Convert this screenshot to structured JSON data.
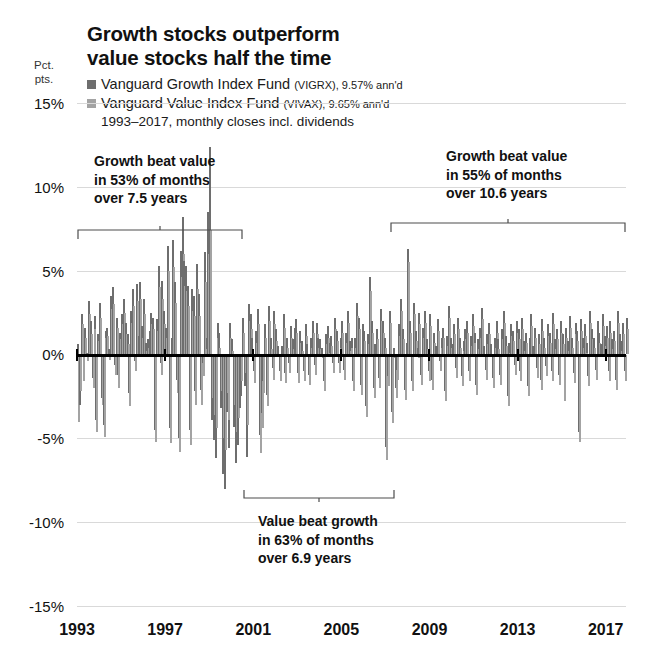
{
  "chart_data": {
    "type": "bar",
    "title": "Growth stocks outperform\nvalue stocks half the time",
    "subtitle": "1993–2017, monthly closes incl. dividends",
    "xlabel": "",
    "ylabel": "Pct.\npts.",
    "ylim": [
      -15,
      15
    ],
    "xlim": [
      1993,
      2017.92
    ],
    "grid": true,
    "legend_position": "top-left",
    "ytick_labels": [
      "15%",
      "10%",
      "5%",
      "0%",
      "-5%",
      "-10%",
      "-15%"
    ],
    "ytick_values": [
      15,
      10,
      5,
      0,
      -5,
      -10,
      -15
    ],
    "xtick_labels": [
      "1993",
      "1997",
      "2001",
      "2005",
      "2009",
      "2013",
      "2017"
    ],
    "xtick_values": [
      1993,
      1997,
      2001,
      2005,
      2009,
      2013,
      2017
    ],
    "series": [
      {
        "name": "Vanguard Growth Index Fund",
        "ticker": "VIGRX",
        "annualized": "9.57% ann'd",
        "color": "#6e6e6e"
      },
      {
        "name": "Vanguard Value Index Fund",
        "ticker": "VIVAX",
        "annualized": "9.65% ann'd",
        "color": "#a3a3a3"
      }
    ],
    "growth_values": [
      0.6,
      -3.0,
      2.4,
      -1.0,
      1.6,
      0.1,
      3.2,
      2.0,
      -1.4,
      2.3,
      -3.9,
      1.2,
      3.1,
      -2.6,
      -4.2,
      1.4,
      1.6,
      0.3,
      3.5,
      4.0,
      -0.6,
      2.2,
      -1.2,
      1.3,
      2.4,
      3.3,
      1.9,
      1.2,
      -2.3,
      2.6,
      3.9,
      -0.4,
      4.2,
      1.1,
      4.3,
      1.7,
      3.3,
      0.7,
      0.9,
      1.4,
      2.5,
      2.2,
      -4.5,
      2.1,
      5.3,
      -0.5,
      4.4,
      2.6,
      1.6,
      6.5,
      -4.4,
      1.0,
      6.8,
      4.3,
      -1.5,
      -5.0,
      6.2,
      8.2,
      5.6,
      5.3,
      4.1,
      -4.5,
      3.9,
      3.5,
      -2.2,
      5.4,
      3.6,
      -2.1,
      -0.5,
      6.1,
      1.0,
      8.5,
      12.4,
      -3.9,
      -5.1,
      -6.2,
      1.9,
      1.3,
      -3.2,
      -7.1,
      -8.0,
      -3.4,
      -5.6,
      1.9,
      0.9,
      -4.3,
      -6.5,
      -5.4,
      -3.2,
      -2.5,
      2.2,
      -1.9,
      -6.1,
      3.0,
      2.4,
      1.0,
      -1.0,
      1.4,
      2.7,
      -4.8,
      -3.5,
      -1.6,
      1.8,
      -2.4,
      2.9,
      1.0,
      -0.8,
      2.6,
      1.5,
      0.5,
      -1.0,
      0.5,
      2.4,
      -1.1,
      1.0,
      -0.5,
      1.7,
      0.9,
      1.6,
      2.1,
      -1.1,
      1.4,
      0.8,
      -1.0,
      1.8,
      0.6,
      -1.2,
      1.0,
      2.0,
      -0.6,
      1.9,
      1.0,
      0.9,
      0.4,
      -1.6,
      1.2,
      1.7,
      0.7,
      1.1,
      -0.5,
      2.2,
      1.4,
      -0.5,
      1.0,
      2.0,
      -0.9,
      1.3,
      2.6,
      0.8,
      1.0,
      -1.6,
      1.0,
      3.1,
      2.2,
      -1.8,
      1.8,
      1.4,
      -3.1,
      1.2,
      4.6,
      2.0,
      -2.0,
      0.6,
      1.5,
      -1.4,
      2.7,
      2.0,
      1.0,
      -5.5,
      -1.3,
      2.6,
      -3.4,
      0.4,
      -2.0,
      -0.9,
      1.8,
      3.3,
      1.5,
      -2.1,
      0.7,
      6.3,
      2.0,
      -1.6,
      3.1,
      1.4,
      0.4,
      2.5,
      -1.2,
      1.6,
      2.6,
      0.9,
      -1.0,
      2.4,
      -1.5,
      1.3,
      0.5,
      2.1,
      -0.4,
      1.0,
      1.6,
      -2.2,
      1.1,
      2.9,
      1.0,
      0.6,
      1.8,
      -0.8,
      2.2,
      1.0,
      -1.3,
      0.8,
      1.5,
      2.0,
      -1.0,
      1.1,
      2.4,
      1.3,
      -1.8,
      0.9,
      1.6,
      2.8,
      0.5,
      -0.9,
      1.2,
      1.9,
      0.6,
      -1.4,
      1.0,
      2.0,
      0.9,
      -1.2,
      1.5,
      2.6,
      1.1,
      -2.5,
      0.7,
      1.8,
      1.4,
      -0.6,
      2.0,
      1.5,
      -1.0,
      2.2,
      0.8,
      1.3,
      -1.9,
      1.0,
      2.4,
      0.5,
      1.6,
      -0.8,
      1.2,
      -1.5,
      2.1,
      1.0,
      -0.7,
      1.8,
      1.3,
      -1.0,
      2.5,
      0.9,
      1.5,
      -1.2,
      2.0,
      1.2,
      -2.2,
      1.6,
      0.8,
      2.3,
      1.0,
      -1.1,
      1.9,
      1.4,
      -4.6,
      2.1,
      1.0,
      1.8,
      0.7,
      -1.3,
      2.6,
      1.5,
      1.0,
      -0.9,
      2.0,
      1.3,
      0.6,
      2.4,
      1.1,
      1.7,
      -1.0,
      2.0,
      0.9,
      1.4,
      -1.5,
      2.6,
      1.2,
      0.8,
      1.9,
      -1.0,
      2.2
    ],
    "value_values": [
      -4.0,
      -2.2,
      1.8,
      -1.6,
      1.0,
      -0.4,
      2.4,
      1.2,
      -2.0,
      1.5,
      -4.6,
      0.8,
      2.2,
      -3.0,
      -4.9,
      1.0,
      1.1,
      -0.3,
      2.7,
      3.0,
      -1.2,
      1.6,
      -2.0,
      0.9,
      1.8,
      2.5,
      1.2,
      0.6,
      -3.1,
      1.9,
      2.9,
      -1.0,
      3.2,
      0.5,
      3.3,
      1.0,
      2.4,
      0.2,
      0.4,
      0.9,
      1.8,
      1.5,
      -5.2,
      1.4,
      4.0,
      -1.2,
      3.3,
      1.8,
      1.0,
      5.0,
      -5.3,
      0.4,
      5.2,
      3.1,
      -2.3,
      -5.8,
      4.6,
      6.0,
      4.1,
      3.8,
      2.9,
      -5.4,
      2.6,
      2.3,
      -3.0,
      3.9,
      2.3,
      -3.0,
      -1.3,
      4.3,
      0.3,
      6.0,
      7.4,
      -2.6,
      -3.6,
      -4.4,
      1.0,
      0.4,
      -2.2,
      -5.0,
      -5.7,
      -2.3,
      -3.9,
      1.0,
      0.2,
      -3.0,
      -4.6,
      -3.8,
      -2.1,
      -1.6,
      1.3,
      -1.1,
      -4.2,
      2.0,
      1.5,
      0.3,
      -1.7,
      0.7,
      1.8,
      -5.9,
      -4.4,
      -2.3,
      1.0,
      -3.1,
      2.0,
      0.3,
      -1.5,
      1.8,
      0.8,
      -0.1,
      -1.6,
      -0.1,
      1.6,
      -1.7,
      0.4,
      -1.1,
      1.0,
      0.3,
      0.9,
      1.3,
      -1.7,
      0.7,
      0.2,
      -1.6,
      1.1,
      0.0,
      -1.8,
      0.4,
      1.3,
      -1.2,
      1.2,
      0.4,
      0.3,
      -0.2,
      -2.2,
      0.6,
      1.0,
      0.1,
      0.5,
      -1.1,
      1.5,
      0.8,
      -1.1,
      0.4,
      1.3,
      -1.5,
      0.7,
      1.9,
      0.2,
      0.4,
      -2.2,
      0.4,
      2.3,
      1.5,
      -2.4,
      1.1,
      0.8,
      -3.7,
      0.6,
      3.8,
      1.3,
      -2.6,
      0.0,
      0.9,
      -2.0,
      2.0,
      1.3,
      0.4,
      -6.3,
      -1.9,
      1.9,
      -4.1,
      -0.2,
      -2.6,
      -1.5,
      1.1,
      2.6,
      0.9,
      -2.7,
      0.1,
      5.5,
      1.3,
      -2.2,
      2.4,
      0.8,
      -0.2,
      1.8,
      -1.8,
      1.0,
      1.9,
      0.3,
      -1.6,
      1.7,
      -2.1,
      0.7,
      -0.1,
      1.4,
      -1.0,
      0.4,
      1.0,
      -2.8,
      0.5,
      2.2,
      0.4,
      0.0,
      1.2,
      -1.4,
      1.5,
      0.4,
      -1.9,
      0.2,
      0.9,
      1.3,
      -1.6,
      0.5,
      1.7,
      0.7,
      -2.4,
      0.3,
      1.0,
      2.1,
      -0.1,
      -1.5,
      0.6,
      1.2,
      0.0,
      -2.0,
      0.4,
      1.3,
      0.3,
      -1.8,
      0.9,
      1.9,
      0.5,
      -3.1,
      0.1,
      1.1,
      0.8,
      -1.2,
      1.3,
      0.9,
      -1.6,
      1.5,
      0.2,
      0.7,
      -2.5,
      0.4,
      1.7,
      -0.1,
      1.0,
      -1.4,
      0.6,
      -2.1,
      1.4,
      0.4,
      -1.3,
      1.1,
      0.7,
      -1.6,
      1.8,
      0.3,
      0.9,
      -1.8,
      1.3,
      0.6,
      -2.8,
      1.0,
      0.2,
      1.6,
      0.4,
      -1.7,
      1.2,
      0.8,
      -5.2,
      1.4,
      0.4,
      1.1,
      0.1,
      -1.9,
      1.9,
      0.9,
      0.4,
      -1.5,
      1.3,
      0.7,
      0.0,
      1.7,
      0.5,
      1.0,
      -1.6,
      1.3,
      0.3,
      0.8,
      -2.1,
      1.9,
      0.6,
      0.2,
      1.2,
      -1.6,
      1.5
    ]
  },
  "annotations": [
    {
      "id": "growth-left",
      "text": "Growth beat value\nin 53% of months\nover 7.5 years"
    },
    {
      "id": "value-middle",
      "text": "Value beat growth\nin 63% of months\nover 6.9 years"
    },
    {
      "id": "growth-right",
      "text": "Growth beat value\nin 55% of months\nover 10.6 years"
    }
  ]
}
